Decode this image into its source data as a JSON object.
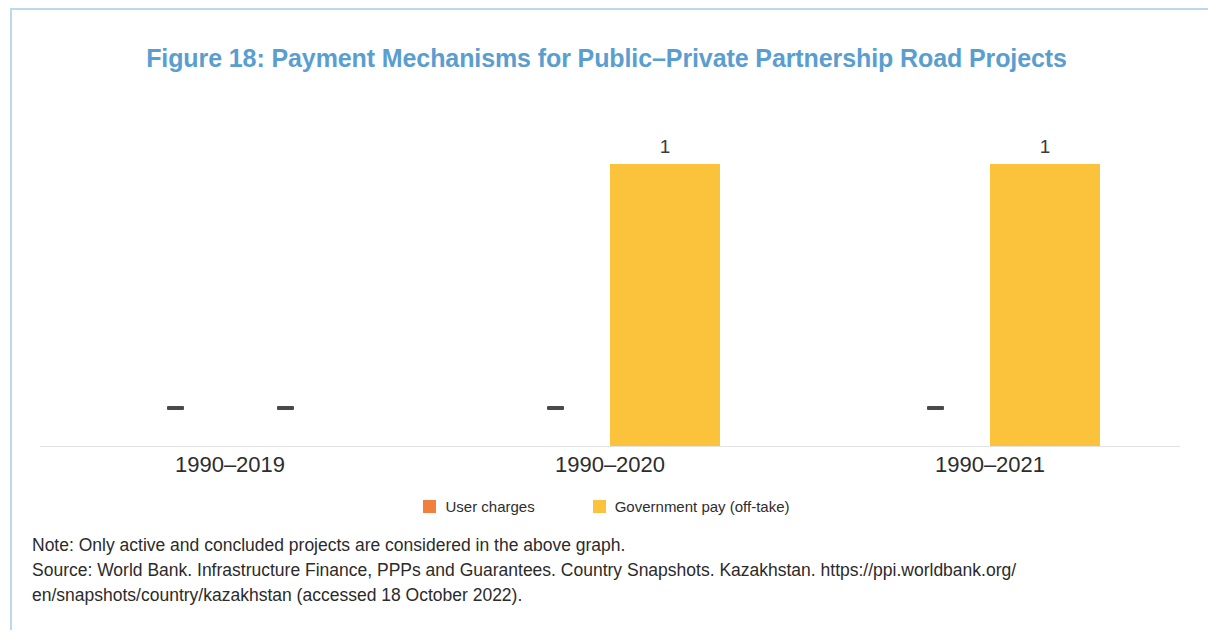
{
  "figure": {
    "title": "Figure 18: Payment Mechanisms for Public–Private Partnership Road Projects",
    "title_color": "#5a9ed0"
  },
  "legend": {
    "items": [
      {
        "label": "User charges",
        "color": "#f0803c"
      },
      {
        "label": "Government pay (off-take)",
        "color": "#fbc23c"
      }
    ]
  },
  "footnotes": {
    "note": "Note: Only active and concluded projects are considered in the above graph.",
    "source_line1": "Source: World Bank. Infrastructure Finance, PPPs and Guarantees. Country Snapshots. Kazakhstan. https://ppi.worldbank.org/",
    "source_line2": "en/snapshots/country/kazakhstan (accessed 18 October 2022)."
  },
  "chart_data": {
    "type": "bar",
    "title": "Figure 18: Payment Mechanisms for Public–Private Partnership Road Projects",
    "xlabel": "",
    "ylabel": "",
    "ylim": [
      0,
      1.12
    ],
    "grid": false,
    "legend_position": "bottom",
    "categories": [
      "1990–2019",
      "1990–2020",
      "1990–2021"
    ],
    "series": [
      {
        "name": "User charges",
        "color": "#f0803c",
        "values": [
          0,
          0,
          0
        ],
        "labels": [
          "–",
          "–",
          "–"
        ]
      },
      {
        "name": "Government pay (off-take)",
        "color": "#fbc23c",
        "values": [
          0,
          1,
          1
        ],
        "labels": [
          "–",
          "1",
          "1"
        ]
      }
    ],
    "zero_marker": "–",
    "bar_color": "#f5c342",
    "note": "Zero values are rendered as a dash marker on the axis; nonzero bars carry the value label above the bar."
  }
}
